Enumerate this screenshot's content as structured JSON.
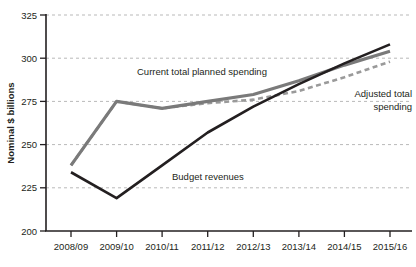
{
  "chart_data": {
    "type": "line",
    "title": "",
    "xlabel": "",
    "ylabel": "Nominal $ billions",
    "categories": [
      "2008/09",
      "2009/10",
      "2010/11",
      "2011/12",
      "2012/13",
      "2013/14",
      "2014/15",
      "2015/16"
    ],
    "ylim": [
      200,
      325
    ],
    "yticks": [
      200,
      225,
      250,
      275,
      300,
      325
    ],
    "ytick_labels": [
      "200",
      "225",
      "250",
      "275",
      "300",
      "325"
    ],
    "grid": "horizontal-dashed",
    "legend": "inline-annotations",
    "series": [
      {
        "name": "Budget revenues",
        "style": "solid",
        "color": "#231f20",
        "values": [
          234,
          219,
          238,
          257,
          272,
          285,
          297,
          308
        ]
      },
      {
        "name": "Current total planned spending",
        "style": "solid",
        "color": "#7a7a7a",
        "values": [
          238,
          275,
          271,
          275,
          279,
          287,
          296,
          304
        ]
      },
      {
        "name": "Adjusted total spending",
        "style": "dashed",
        "color": "#9a9a9a",
        "values": [
          238,
          275,
          271,
          274,
          276,
          281,
          289,
          298
        ]
      }
    ],
    "annotations": [
      {
        "id": "current-total-planned-spending",
        "text": "Current total planned spending"
      },
      {
        "id": "adjusted-total-spending",
        "line1": "Adjusted total",
        "line2": "spending"
      },
      {
        "id": "budget-revenues",
        "text": "Budget revenues"
      }
    ]
  }
}
